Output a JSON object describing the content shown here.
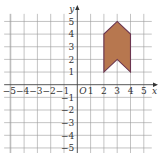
{
  "diagram": {
    "type": "coordinate-grid",
    "x_axis": {
      "label": "x",
      "min": -5,
      "max": 5
    },
    "y_axis": {
      "label": "y",
      "min": -5,
      "max": 5
    },
    "origin_label": "O",
    "x_tick_labels": [
      "−5",
      "−4",
      "−3",
      "−2",
      "−1",
      "1",
      "2",
      "3",
      "4",
      "5"
    ],
    "x_tick_values": [
      -5,
      -4,
      -3,
      -2,
      -1,
      1,
      2,
      3,
      4,
      5
    ],
    "y_tick_labels": [
      "5",
      "4",
      "3",
      "2",
      "1",
      "−1",
      "−2",
      "−3",
      "−4",
      "−5"
    ],
    "y_tick_values": [
      5,
      4,
      3,
      2,
      1,
      -1,
      -2,
      -3,
      -4,
      -5
    ],
    "shape": {
      "name": "chevron",
      "vertices": [
        [
          2,
          1
        ],
        [
          2,
          4
        ],
        [
          3,
          5
        ],
        [
          4,
          4
        ],
        [
          4,
          1
        ],
        [
          3,
          2
        ]
      ],
      "fill": "#b7774f",
      "stroke": "#6b3550"
    }
  }
}
